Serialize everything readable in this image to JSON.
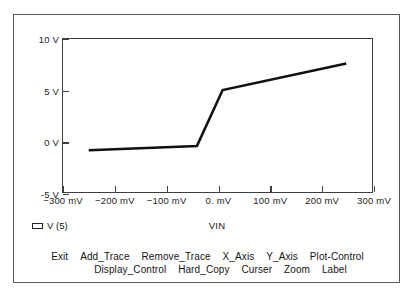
{
  "chart_data": {
    "type": "line",
    "title": "",
    "subtitle": "",
    "xlabel": "VIN",
    "ylabel": "",
    "grid": false,
    "legend_position": "bottom-left",
    "x_unit": "mV",
    "y_unit": "V",
    "xlim": [
      -300,
      300
    ],
    "ylim": [
      -5,
      10
    ],
    "x_ticks": [
      -300,
      -200,
      -100,
      0,
      100,
      200,
      300
    ],
    "x_tick_labels": [
      "−300 mV",
      "−200 mV",
      "−100 mV",
      "0. mV",
      "100 mV",
      "200 mV",
      "300 mV"
    ],
    "y_ticks": [
      10,
      5,
      0,
      -5
    ],
    "y_tick_labels": [
      "10 V",
      "5 V",
      "0 V",
      "-5 V"
    ],
    "series": [
      {
        "name": "V (5)",
        "color": "#111111",
        "x": [
          -250,
          -40,
          10,
          250
        ],
        "values": [
          -0.9,
          -0.5,
          5.0,
          7.6
        ]
      }
    ]
  },
  "legend": {
    "entries": [
      {
        "label": "V (5)",
        "swatch": "legend-swatch"
      }
    ]
  },
  "axis_titles": {
    "x": "VIN"
  },
  "menu": {
    "row1": [
      "Exit",
      "Add_Trace",
      "Remove_Trace",
      "X_Axis",
      "Y_Axis",
      "Plot-Control"
    ],
    "row2": [
      "Display_Control",
      "Hard_Copy",
      "Curser",
      "Zoom",
      "Label"
    ]
  },
  "colors": {
    "trace": "#111111",
    "axis": "#3a3f42",
    "frame": "#555b5e",
    "text": "#141414",
    "background": "#ffffff"
  }
}
